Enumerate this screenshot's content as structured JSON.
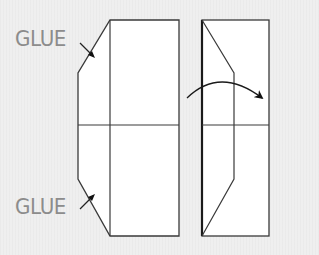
{
  "labels": {
    "glue_top": "GLUE",
    "glue_bottom": "GLUE"
  },
  "colors": {
    "background": "#efefef",
    "paper": "#ffffff",
    "line": "#3a3a3a",
    "label": "#8c8c8c"
  },
  "figures": [
    {
      "name": "unfolded-sheet",
      "description": "Sheet with angled glue flaps on left edge, divided by a vertical and horizontal crease"
    },
    {
      "name": "folding-sheet",
      "description": "Sheet with the left flap folded over, curved arrow indicating fold direction to the right"
    }
  ]
}
